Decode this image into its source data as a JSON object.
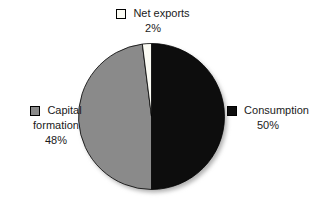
{
  "chart_data": {
    "type": "pie",
    "title": "",
    "categories": [
      "Consumption",
      "Capital formation",
      "Net exports"
    ],
    "values": [
      50,
      48,
      2
    ],
    "slices": [
      {
        "label": "Consumption",
        "pct": 50,
        "color": "#0d0d0d"
      },
      {
        "label": "Capital formation",
        "pct": 48,
        "color": "#8a8a8a"
      },
      {
        "label": "Net exports",
        "pct": 2,
        "color": "#fbfbf4"
      }
    ],
    "start_angle_deg": -90,
    "direction": "clockwise",
    "stroke_color": "#000000",
    "shadow_color": "#b0b0b0",
    "legend_position": "around-pie",
    "background": "#ffffff"
  },
  "labels": {
    "net_exports": {
      "name": "Net exports",
      "pct": "2%"
    },
    "consumption": {
      "name": "Consumption",
      "pct": "50%"
    },
    "capital_formation": {
      "line1": "Capital",
      "line2": "formation",
      "pct": "48%"
    }
  }
}
